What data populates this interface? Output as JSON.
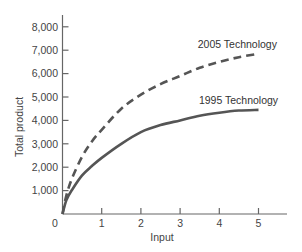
{
  "chart_data": {
    "type": "line",
    "title": "",
    "xlabel": "Input",
    "ylabel": "Total product",
    "xlim": [
      0,
      5.7
    ],
    "ylim": [
      0,
      8500
    ],
    "grid": false,
    "legend": "inline annotations",
    "x_ticks": [
      1,
      2,
      3,
      4,
      5
    ],
    "x_tick_labels": [
      "1",
      "2",
      "3",
      "4",
      "5"
    ],
    "origin_label": "0",
    "y_ticks": [
      1000,
      2000,
      3000,
      4000,
      5000,
      6000,
      7000,
      8000
    ],
    "y_tick_labels": [
      "1,000",
      "2,000",
      "3,000",
      "4,000",
      "5,000",
      "6,000",
      "7,000",
      "8,000"
    ],
    "x": [
      0,
      0.1,
      0.25,
      0.5,
      0.75,
      1,
      1.5,
      2,
      2.5,
      3,
      3.5,
      4,
      4.5,
      5
    ],
    "series": [
      {
        "name": "2005 Technology",
        "style": "dashed",
        "color": "#555555",
        "values": [
          0,
          800,
          1550,
          2450,
          3100,
          3600,
          4500,
          5100,
          5550,
          5900,
          6250,
          6500,
          6700,
          6850
        ]
      },
      {
        "name": "1995 Technology",
        "style": "solid",
        "color": "#555555",
        "values": [
          0,
          600,
          1050,
          1650,
          2050,
          2400,
          3000,
          3500,
          3800,
          4000,
          4200,
          4330,
          4420,
          4450
        ]
      }
    ],
    "annotations": [
      {
        "text": "2005 Technology",
        "x": 3.45,
        "y": 7100
      },
      {
        "text": "1995 Technology",
        "x": 3.48,
        "y": 4700
      }
    ]
  },
  "colors": {
    "axis": "#666666",
    "text": "#444444",
    "line": "#555555"
  }
}
